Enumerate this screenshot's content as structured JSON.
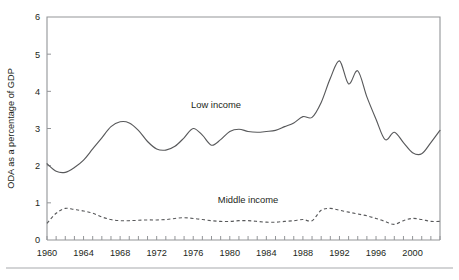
{
  "chart_data": {
    "type": "line",
    "title": "",
    "subtitle": "",
    "xlabel": "",
    "ylabel": "ODA as a percentage of GDP",
    "xlim": [
      1960,
      2003
    ],
    "ylim": [
      0,
      6
    ],
    "yticks": [
      0,
      1,
      2,
      3,
      4,
      5,
      6
    ],
    "ytick_labels": [
      "0",
      "1",
      "2",
      "3",
      "4",
      "5",
      "6"
    ],
    "xticks": [
      1960,
      1964,
      1968,
      1972,
      1976,
      1980,
      1984,
      1988,
      1992,
      1996,
      2000
    ],
    "xtick_labels": [
      "1960",
      "1964",
      "1968",
      "1972",
      "1976",
      "1980",
      "1984",
      "1988",
      "1992",
      "1996",
      "2000"
    ],
    "minor_xticks_every": 1,
    "grid": false,
    "legend_position": "inline-annotation",
    "x": [
      1960,
      1961,
      1962,
      1963,
      1964,
      1965,
      1966,
      1967,
      1968,
      1969,
      1970,
      1971,
      1972,
      1973,
      1974,
      1975,
      1976,
      1977,
      1978,
      1979,
      1980,
      1981,
      1982,
      1983,
      1984,
      1985,
      1986,
      1987,
      1988,
      1989,
      1990,
      1991,
      1992,
      1993,
      1994,
      1995,
      1996,
      1997,
      1998,
      1999,
      2000,
      2001,
      2002,
      2003
    ],
    "series": [
      {
        "name": "Low income",
        "style": "solid",
        "color": "#58595b",
        "label_text": "Low income",
        "values": [
          2.05,
          1.85,
          1.82,
          1.95,
          2.15,
          2.45,
          2.75,
          3.05,
          3.18,
          3.15,
          2.95,
          2.65,
          2.45,
          2.42,
          2.52,
          2.75,
          3.0,
          2.82,
          2.55,
          2.7,
          2.92,
          2.98,
          2.92,
          2.9,
          2.92,
          2.95,
          3.05,
          3.15,
          3.32,
          3.3,
          3.7,
          4.35,
          4.82,
          4.2,
          4.55,
          3.85,
          3.25,
          2.7,
          2.9,
          2.62,
          2.35,
          2.32,
          2.62,
          2.95
        ]
      },
      {
        "name": "Middle income",
        "style": "dashed",
        "color": "#58595b",
        "label_text": "Middle income",
        "values": [
          0.45,
          0.72,
          0.85,
          0.82,
          0.78,
          0.72,
          0.62,
          0.55,
          0.52,
          0.52,
          0.53,
          0.54,
          0.54,
          0.55,
          0.58,
          0.6,
          0.58,
          0.55,
          0.52,
          0.5,
          0.5,
          0.52,
          0.52,
          0.5,
          0.48,
          0.48,
          0.5,
          0.52,
          0.55,
          0.52,
          0.8,
          0.85,
          0.8,
          0.75,
          0.7,
          0.65,
          0.58,
          0.5,
          0.42,
          0.52,
          0.58,
          0.55,
          0.5,
          0.5
        ]
      }
    ],
    "annotations": [
      {
        "text": "Low income",
        "x": 1978.5,
        "y": 3.55
      },
      {
        "text": "Middle income",
        "x": 1982.0,
        "y": 1.0
      }
    ]
  },
  "layout": {
    "plot_left": 47,
    "plot_right": 440,
    "plot_top": 17,
    "plot_bottom": 240,
    "footer_rule_y": 268
  },
  "colors": {
    "axis": "#939598",
    "line": "#58595b",
    "text": "#231f20",
    "rule": "#a7a9ac",
    "background": "#ffffff"
  }
}
